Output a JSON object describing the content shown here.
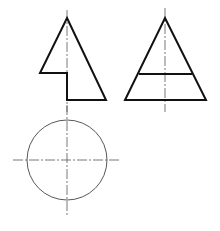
{
  "diagram": {
    "type": "orthographic-projection",
    "colors": {
      "outline": "#111111",
      "centerline": "#555555",
      "background": "#ffffff"
    },
    "views": [
      {
        "name": "front-view",
        "shape": "notched-triangle",
        "points": [
          [
            67,
            18
          ],
          [
            106,
            100
          ],
          [
            67,
            100
          ],
          [
            67,
            73
          ],
          [
            40,
            73
          ]
        ],
        "centerline": {
          "x": 67,
          "y1": 10,
          "y2": 112
        }
      },
      {
        "name": "side-view",
        "shape": "triangle-with-band",
        "points": [
          [
            165,
            18
          ],
          [
            206,
            100
          ],
          [
            125,
            100
          ]
        ],
        "band_line": {
          "x1": 139,
          "x2": 192,
          "y": 74
        },
        "centerline": {
          "x": 165,
          "y1": 8,
          "y2": 112
        }
      },
      {
        "name": "top-view",
        "shape": "circle",
        "center": [
          67,
          160
        ],
        "radius": 40,
        "centerline_h": {
          "x1": 13,
          "x2": 120,
          "y": 160
        },
        "centerline_v": {
          "x": 67,
          "y1": 105,
          "y2": 215
        }
      }
    ]
  }
}
